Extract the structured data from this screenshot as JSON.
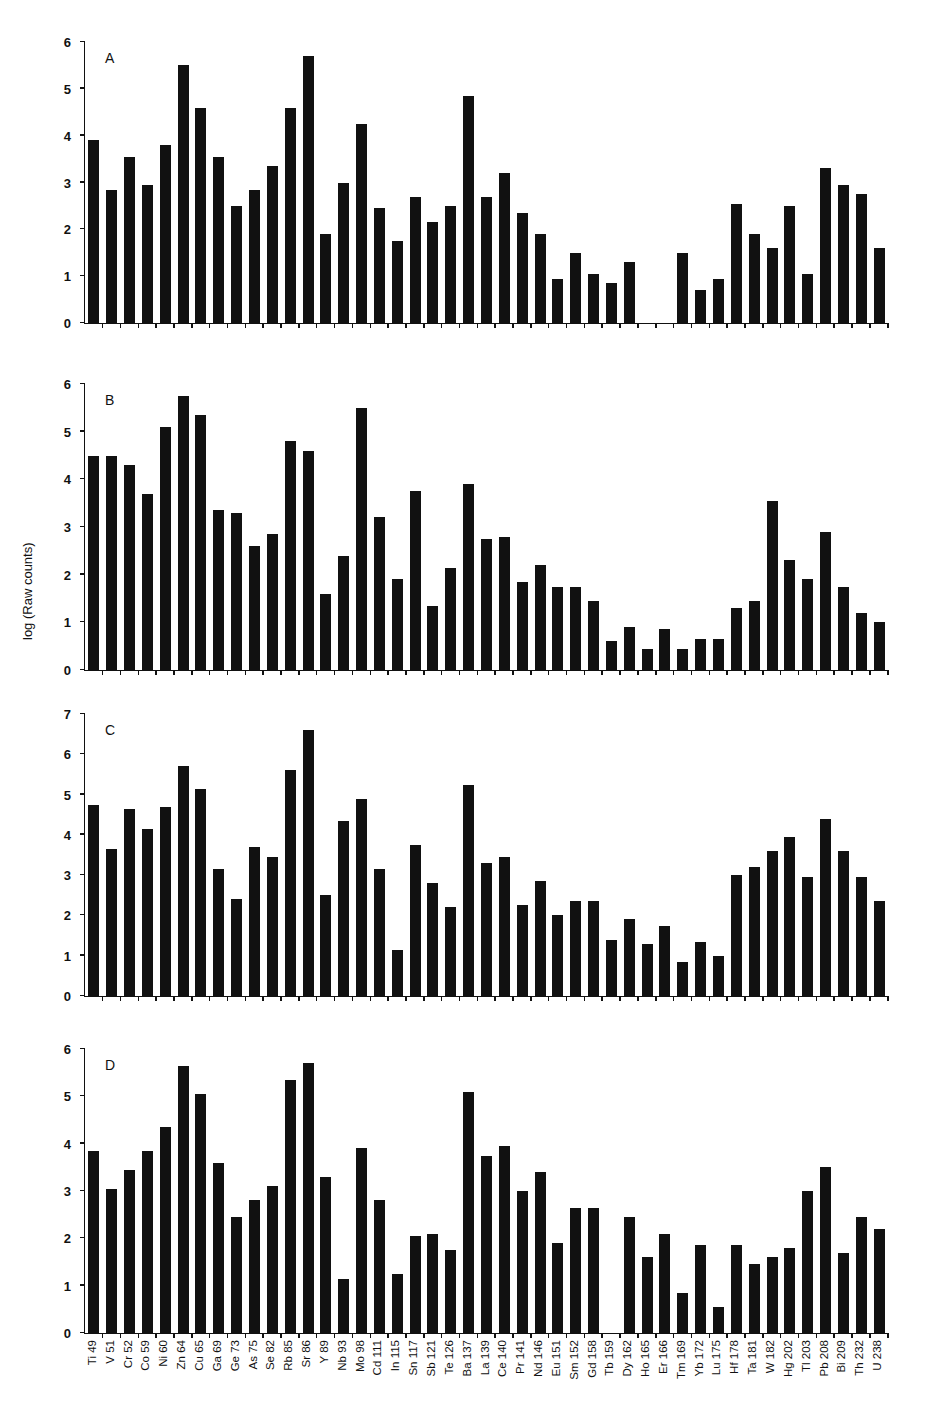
{
  "chart_data": {
    "type": "bar",
    "ylabel": "log (Raw counts)",
    "xlabel": "",
    "categories": [
      "Ti 49",
      "V 51",
      "Cr 52",
      "Co 59",
      "Ni 60",
      "Zn 64",
      "Cu 65",
      "Ga 69",
      "Ge 73",
      "As 75",
      "Se 82",
      "Rb 85",
      "Sr 86",
      "Y 89",
      "Nb 93",
      "Mo 98",
      "Cd 111",
      "In 115",
      "Sn 117",
      "Sb 121",
      "Te 126",
      "Ba 137",
      "La 139",
      "Ce 140",
      "Pr 141",
      "Nd 146",
      "Eu 151",
      "Sm 152",
      "Gd 158",
      "Tb 159",
      "Dy 162",
      "Ho 165",
      "Er 166",
      "Tm 169",
      "Yb 172",
      "Lu 175",
      "Hf 178",
      "Ta 181",
      "W 182",
      "Hg 202",
      "Tl 203",
      "Pb 208",
      "Bi 209",
      "Th 232",
      "U 238"
    ],
    "panels": [
      {
        "label": "A",
        "ylim": [
          0,
          6
        ],
        "yticks": [
          0,
          1,
          2,
          3,
          4,
          5,
          6
        ],
        "values": [
          3.9,
          2.85,
          3.55,
          2.95,
          3.8,
          5.5,
          4.6,
          3.55,
          2.5,
          2.85,
          3.35,
          4.6,
          5.7,
          1.9,
          3.0,
          4.25,
          2.45,
          1.75,
          2.7,
          2.15,
          2.5,
          4.85,
          2.7,
          3.2,
          2.35,
          1.9,
          0.95,
          1.5,
          1.05,
          0.85,
          1.3,
          0,
          0,
          1.5,
          0.7,
          0.95,
          2.55,
          1.9,
          1.6,
          2.5,
          1.05,
          3.3,
          2.95,
          2.75,
          1.6
        ]
      },
      {
        "label": "B",
        "ylim": [
          0,
          6
        ],
        "yticks": [
          0,
          1,
          2,
          3,
          4,
          5,
          6
        ],
        "values": [
          4.5,
          4.5,
          4.3,
          3.7,
          5.1,
          5.75,
          5.35,
          3.35,
          3.3,
          2.6,
          2.85,
          4.8,
          4.6,
          1.6,
          2.4,
          5.5,
          3.2,
          1.9,
          3.75,
          1.35,
          2.15,
          3.9,
          2.75,
          2.8,
          1.85,
          2.2,
          1.75,
          1.75,
          1.45,
          0.6,
          0.9,
          0.45,
          0.85,
          0.45,
          0.65,
          0.65,
          1.3,
          1.45,
          3.55,
          2.3,
          1.9,
          2.9,
          1.75,
          1.2,
          1.0
        ]
      },
      {
        "label": "C",
        "ylim": [
          0,
          7
        ],
        "yticks": [
          0,
          1,
          2,
          3,
          4,
          5,
          6,
          7
        ],
        "values": [
          4.75,
          3.65,
          4.65,
          4.15,
          4.7,
          5.7,
          5.15,
          3.15,
          2.4,
          3.7,
          3.45,
          5.6,
          6.6,
          2.5,
          4.35,
          4.9,
          3.15,
          1.15,
          3.75,
          2.8,
          2.2,
          5.25,
          3.3,
          3.45,
          2.25,
          2.85,
          2.0,
          2.35,
          2.35,
          1.4,
          1.9,
          1.3,
          1.75,
          0.85,
          1.35,
          1.0,
          3.0,
          3.2,
          3.6,
          3.95,
          2.95,
          4.4,
          3.6,
          2.95,
          2.35
        ]
      },
      {
        "label": "D",
        "ylim": [
          0,
          6
        ],
        "yticks": [
          0,
          1,
          2,
          3,
          4,
          5,
          6
        ],
        "values": [
          3.85,
          3.05,
          3.45,
          3.85,
          4.35,
          5.65,
          5.05,
          3.6,
          2.45,
          2.8,
          3.1,
          5.35,
          5.7,
          3.3,
          1.15,
          3.9,
          2.8,
          1.25,
          2.05,
          2.1,
          1.75,
          5.1,
          3.75,
          3.95,
          3.0,
          3.4,
          1.9,
          2.65,
          2.65,
          0,
          2.45,
          1.6,
          2.1,
          0.85,
          1.85,
          0.55,
          1.85,
          1.45,
          1.6,
          1.8,
          3.0,
          3.5,
          1.7,
          2.45,
          2.2
        ]
      }
    ],
    "grid": false,
    "legend": null
  }
}
